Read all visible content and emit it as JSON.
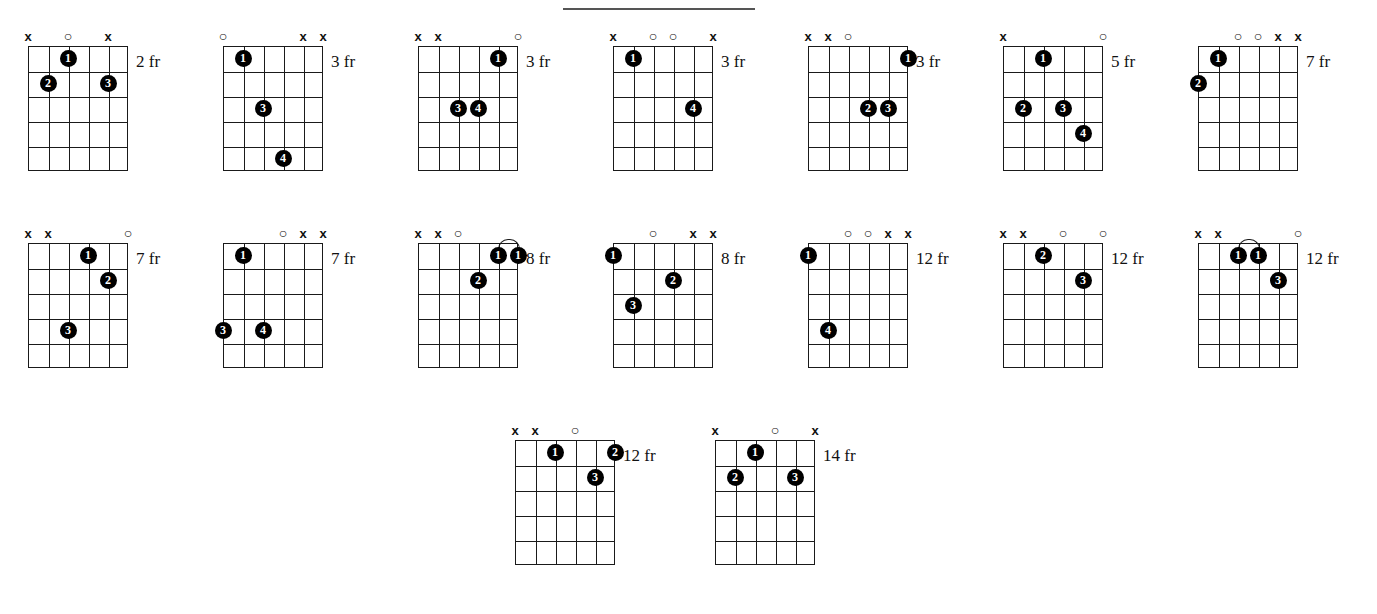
{
  "page": {
    "strings": 6,
    "frets": 5,
    "divider": true
  },
  "legend": {
    "muted_symbol": "x",
    "open_symbol": "o",
    "fret_suffix": "fr"
  },
  "rows": [
    {
      "chords": [
        {
          "fret_label": "2 fr",
          "markers": [
            "x",
            "",
            "o",
            "",
            "x",
            ""
          ],
          "dots": [
            {
              "finger": "1",
              "string": 3,
              "fret": 1
            },
            {
              "finger": "2",
              "string": 2,
              "fret": 2
            },
            {
              "finger": "3",
              "string": 5,
              "fret": 2
            }
          ],
          "barres": []
        },
        {
          "fret_label": "3 fr",
          "markers": [
            "o",
            "",
            "",
            "",
            "x",
            "x"
          ],
          "dots": [
            {
              "finger": "1",
              "string": 2,
              "fret": 1
            },
            {
              "finger": "3",
              "string": 3,
              "fret": 3
            },
            {
              "finger": "4",
              "string": 4,
              "fret": 5
            }
          ],
          "barres": []
        },
        {
          "fret_label": "3 fr",
          "markers": [
            "x",
            "x",
            "",
            "",
            "",
            "o"
          ],
          "dots": [
            {
              "finger": "1",
              "string": 5,
              "fret": 1
            },
            {
              "finger": "3",
              "string": 3,
              "fret": 3
            },
            {
              "finger": "4",
              "string": 4,
              "fret": 3
            }
          ],
          "barres": []
        },
        {
          "fret_label": "3 fr",
          "markers": [
            "x",
            "",
            "o",
            "o",
            "",
            "x"
          ],
          "dots": [
            {
              "finger": "1",
              "string": 2,
              "fret": 1
            },
            {
              "finger": "4",
              "string": 5,
              "fret": 3
            }
          ],
          "barres": []
        },
        {
          "fret_label": "3 fr",
          "markers": [
            "x",
            "x",
            "o",
            "",
            "",
            ""
          ],
          "dots": [
            {
              "finger": "1",
              "string": 6,
              "fret": 1
            },
            {
              "finger": "2",
              "string": 4,
              "fret": 3
            },
            {
              "finger": "3",
              "string": 5,
              "fret": 3
            }
          ],
          "barres": []
        },
        {
          "fret_label": "5 fr",
          "markers": [
            "x",
            "",
            "",
            "",
            "",
            "o"
          ],
          "dots": [
            {
              "finger": "1",
              "string": 3,
              "fret": 1
            },
            {
              "finger": "2",
              "string": 2,
              "fret": 3
            },
            {
              "finger": "3",
              "string": 4,
              "fret": 3
            },
            {
              "finger": "4",
              "string": 5,
              "fret": 4
            }
          ],
          "barres": []
        },
        {
          "fret_label": "7 fr",
          "markers": [
            "",
            "",
            "o",
            "o",
            "x",
            "x"
          ],
          "dots": [
            {
              "finger": "1",
              "string": 2,
              "fret": 1
            },
            {
              "finger": "2",
              "string": 1,
              "fret": 2
            }
          ],
          "barres": []
        }
      ]
    },
    {
      "chords": [
        {
          "fret_label": "7 fr",
          "markers": [
            "x",
            "x",
            "",
            "",
            "",
            "o"
          ],
          "dots": [
            {
              "finger": "1",
              "string": 4,
              "fret": 1
            },
            {
              "finger": "2",
              "string": 5,
              "fret": 2
            },
            {
              "finger": "3",
              "string": 3,
              "fret": 4
            }
          ],
          "barres": []
        },
        {
          "fret_label": "7 fr",
          "markers": [
            "",
            "",
            "",
            "o",
            "x",
            "x"
          ],
          "dots": [
            {
              "finger": "1",
              "string": 2,
              "fret": 1
            },
            {
              "finger": "3",
              "string": 1,
              "fret": 4
            },
            {
              "finger": "4",
              "string": 3,
              "fret": 4
            }
          ],
          "barres": []
        },
        {
          "fret_label": "8 fr",
          "markers": [
            "x",
            "x",
            "o",
            "",
            "",
            ""
          ],
          "dots": [
            {
              "finger": "1",
              "string": 5,
              "fret": 1
            },
            {
              "finger": "1",
              "string": 6,
              "fret": 1
            },
            {
              "finger": "2",
              "string": 4,
              "fret": 2
            }
          ],
          "barres": [
            {
              "fret": 1,
              "from_string": 5,
              "to_string": 6
            }
          ]
        },
        {
          "fret_label": "8 fr",
          "markers": [
            "",
            "",
            "o",
            "",
            "x",
            "x"
          ],
          "dots": [
            {
              "finger": "1",
              "string": 1,
              "fret": 1
            },
            {
              "finger": "2",
              "string": 4,
              "fret": 2
            },
            {
              "finger": "3",
              "string": 2,
              "fret": 3
            }
          ],
          "barres": []
        },
        {
          "fret_label": "12 fr",
          "markers": [
            "",
            "",
            "o",
            "o",
            "x",
            "x"
          ],
          "dots": [
            {
              "finger": "1",
              "string": 1,
              "fret": 1
            },
            {
              "finger": "4",
              "string": 2,
              "fret": 4
            }
          ],
          "barres": []
        },
        {
          "fret_label": "12 fr",
          "markers": [
            "x",
            "x",
            "",
            "o",
            "",
            "o"
          ],
          "dots": [
            {
              "finger": "2",
              "string": 3,
              "fret": 1
            },
            {
              "finger": "3",
              "string": 5,
              "fret": 2
            }
          ],
          "barres": []
        },
        {
          "fret_label": "12 fr",
          "markers": [
            "x",
            "x",
            "",
            "",
            "",
            "o"
          ],
          "dots": [
            {
              "finger": "1",
              "string": 3,
              "fret": 1
            },
            {
              "finger": "1",
              "string": 4,
              "fret": 1
            },
            {
              "finger": "3",
              "string": 5,
              "fret": 2
            }
          ],
          "barres": [
            {
              "fret": 1,
              "from_string": 3,
              "to_string": 4
            }
          ]
        }
      ]
    },
    {
      "chords": [
        {
          "fret_label": "12 fr",
          "markers": [
            "x",
            "x",
            "",
            "o",
            "",
            ""
          ],
          "dots": [
            {
              "finger": "1",
              "string": 3,
              "fret": 1
            },
            {
              "finger": "2",
              "string": 6,
              "fret": 1
            },
            {
              "finger": "3",
              "string": 5,
              "fret": 2
            }
          ],
          "barres": []
        },
        {
          "fret_label": "14 fr",
          "markers": [
            "x",
            "",
            "",
            "o",
            "",
            "x"
          ],
          "dots": [
            {
              "finger": "1",
              "string": 3,
              "fret": 1
            },
            {
              "finger": "2",
              "string": 2,
              "fret": 2
            },
            {
              "finger": "3",
              "string": 5,
              "fret": 2
            }
          ],
          "barres": []
        }
      ]
    }
  ]
}
